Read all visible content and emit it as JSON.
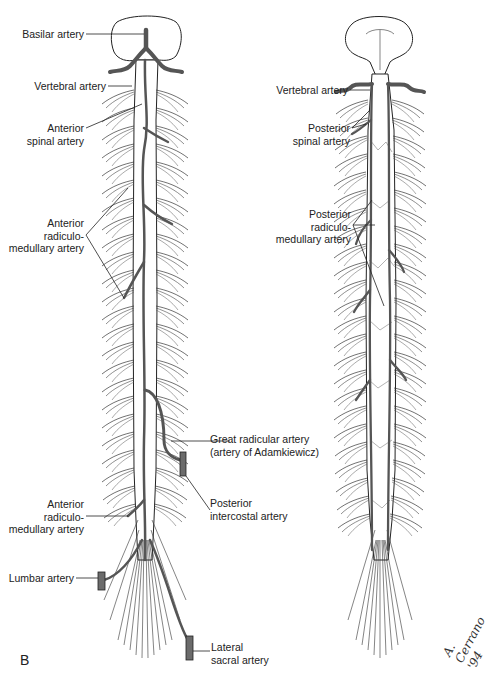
{
  "figure": {
    "panel_letter": "B",
    "signature": "A. Cerrano '94",
    "colors": {
      "artery_fill": "#6b6b6b",
      "artery_stroke": "#222222",
      "cord_fill": "#ffffff",
      "ink": "#1a1a1a",
      "background": "#ffffff"
    }
  },
  "left_panel": {
    "view": "anterior",
    "labels": [
      {
        "id": "basilar",
        "text": "Basilar artery"
      },
      {
        "id": "vertebral",
        "text": "Vertebral artery"
      },
      {
        "id": "anterior_spinal_1",
        "text": "Anterior"
      },
      {
        "id": "anterior_spinal_2",
        "text": "spinal artery"
      },
      {
        "id": "ant_radic_1",
        "text": "Anterior"
      },
      {
        "id": "ant_radic_2",
        "text": "radiculo-"
      },
      {
        "id": "ant_radic_3",
        "text": "medullary artery"
      },
      {
        "id": "great_radic_1",
        "text": "Great radicular artery"
      },
      {
        "id": "great_radic_2",
        "text": "(artery of Adamkiewicz)"
      },
      {
        "id": "post_intercostal_1",
        "text": "Posterior"
      },
      {
        "id": "post_intercostal_2",
        "text": "intercostal artery"
      },
      {
        "id": "ant_radic_low_1",
        "text": "Anterior"
      },
      {
        "id": "ant_radic_low_2",
        "text": "radiculo-"
      },
      {
        "id": "ant_radic_low_3",
        "text": "medullary artery"
      },
      {
        "id": "lumbar",
        "text": "Lumbar artery"
      },
      {
        "id": "lateral_sacral_1",
        "text": "Lateral"
      },
      {
        "id": "lateral_sacral_2",
        "text": "sacral artery"
      }
    ]
  },
  "right_panel": {
    "view": "posterior",
    "labels": [
      {
        "id": "vertebral",
        "text": "Vertebral artery"
      },
      {
        "id": "post_spinal_1",
        "text": "Posterior"
      },
      {
        "id": "post_spinal_2",
        "text": "spinal artery"
      },
      {
        "id": "post_radic_1",
        "text": "Posterior"
      },
      {
        "id": "post_radic_2",
        "text": "radiculo-"
      },
      {
        "id": "post_radic_3",
        "text": "medullary artery"
      }
    ]
  }
}
